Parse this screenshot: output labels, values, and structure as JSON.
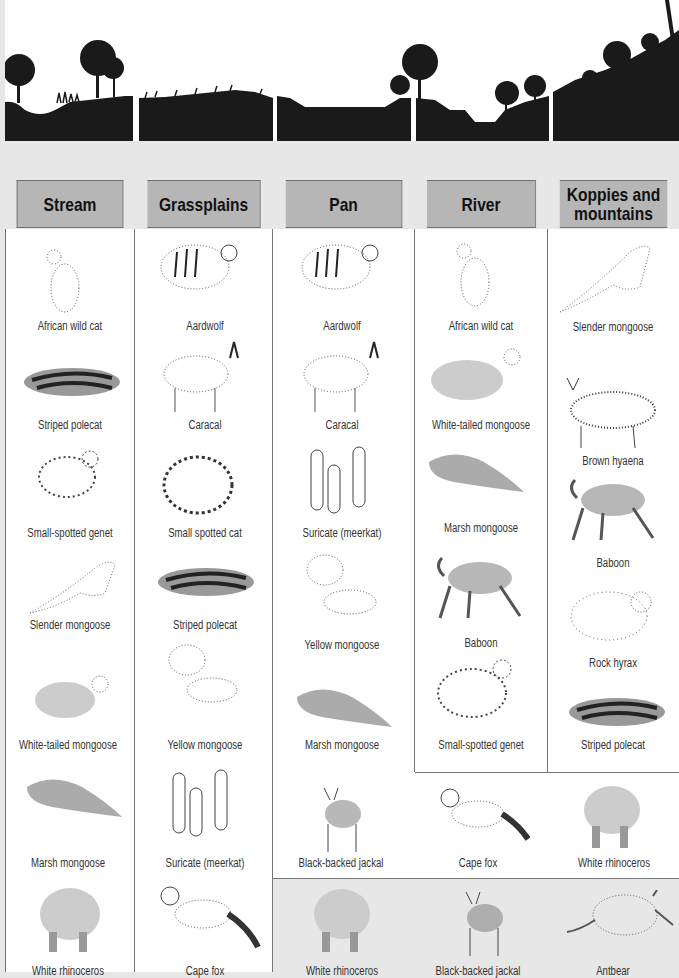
{
  "habitat_scene": {
    "description": "silhouette landscape cross-section",
    "dividers_x": [
      131,
      271,
      409,
      546
    ]
  },
  "table": {
    "headers": [
      {
        "id": "stream",
        "label": "Stream"
      },
      {
        "id": "grassplains",
        "label": "Grassplains"
      },
      {
        "id": "pan",
        "label": "Pan"
      },
      {
        "id": "river",
        "label": "River"
      },
      {
        "id": "koppies",
        "label_line1": "Koppies and",
        "label_line2": "mountains"
      }
    ],
    "stream": [
      "African wild cat",
      "Striped polecat",
      "Small-spotted genet",
      "Slender mongoose",
      "White-tailed mongoose",
      "Marsh mongoose",
      "White rhinoceros"
    ],
    "grassplains": [
      "Aardwolf",
      "Caracal",
      "Small spotted cat",
      "Striped polecat",
      "Yellow mongoose",
      "Suricate (meerkat)",
      "Cape fox"
    ],
    "pan": [
      "Aardwolf",
      "Caracal",
      "Suricate (meerkat)",
      "Yellow mongoose",
      "Marsh mongoose"
    ],
    "river": [
      "African wild cat",
      "White-tailed mongoose",
      "Marsh mongoose",
      "Baboon",
      "Small-spotted genet"
    ],
    "koppies": [
      "Slender mongoose",
      "Brown hyaena",
      "Baboon",
      "Rock hyrax",
      "Striped polecat"
    ],
    "shared_pan_river_koppies": [
      "Black-backed jackal",
      "Cape fox",
      "White rhinoceros"
    ],
    "bottom_row_pan_river_koppies": [
      "White rhinoceros",
      "Black-backed jackal",
      "Antbear"
    ]
  },
  "colors": {
    "page_bg": "#e7e7e7",
    "header_bg": "#b6b6b6",
    "silhouette": "#1a1a1a",
    "border": "#777777"
  }
}
